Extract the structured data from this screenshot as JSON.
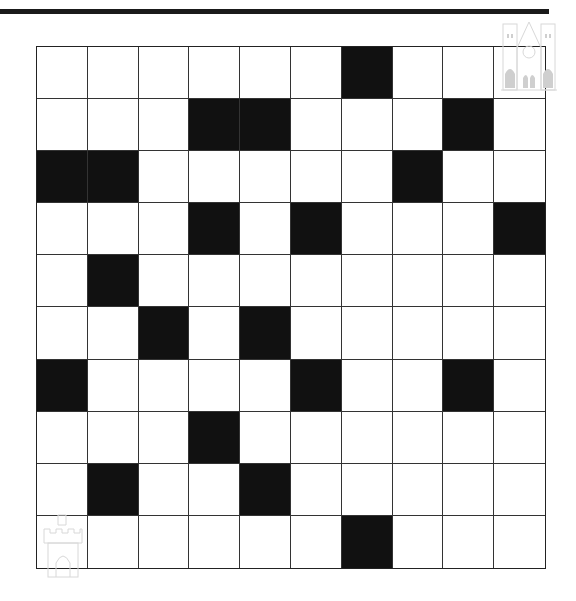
{
  "puzzle": {
    "rows": 10,
    "cols": 10,
    "colors": {
      "blocked": "#111111",
      "open": "#ffffff",
      "line": "#333333",
      "top_bar": "#1a1a1a"
    },
    "blocked_cells": [
      [
        1,
        7
      ],
      [
        2,
        4
      ],
      [
        2,
        5
      ],
      [
        2,
        9
      ],
      [
        3,
        1
      ],
      [
        3,
        2
      ],
      [
        3,
        8
      ],
      [
        4,
        4
      ],
      [
        4,
        6
      ],
      [
        4,
        10
      ],
      [
        5,
        2
      ],
      [
        6,
        3
      ],
      [
        6,
        5
      ],
      [
        7,
        1
      ],
      [
        7,
        6
      ],
      [
        7,
        9
      ],
      [
        8,
        4
      ],
      [
        9,
        2
      ],
      [
        9,
        5
      ],
      [
        10,
        7
      ]
    ],
    "start": {
      "row": 10,
      "col": 1,
      "icon": "castle-icon"
    },
    "goal": {
      "row": 1,
      "col": 10,
      "icon": "cathedral-icon"
    }
  }
}
